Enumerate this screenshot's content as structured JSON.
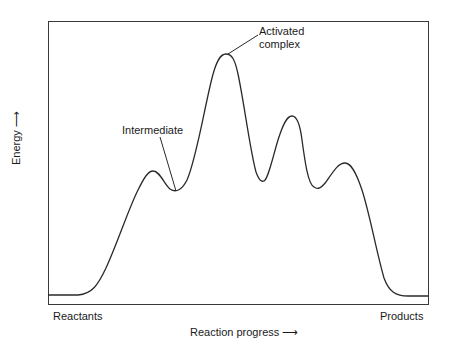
{
  "diagram": {
    "type": "reaction-energy-profile",
    "y_axis_label": "Energy ⟶",
    "x_axis_label": "Reaction progress ⟶",
    "x_start_label": "Reactants",
    "x_end_label": "Products",
    "annotations": {
      "intermediate": "Intermediate",
      "activated_complex_line1": "Activated",
      "activated_complex_line2": "complex"
    },
    "line_color": "#2a2a2a",
    "curve_points": [
      {
        "x": 48,
        "y": 295,
        "note": "reactants baseline"
      },
      {
        "x": 152,
        "y": 171,
        "note": "first small peak"
      },
      {
        "x": 176,
        "y": 190,
        "note": "intermediate (local minimum)"
      },
      {
        "x": 226,
        "y": 54,
        "note": "activated complex (highest peak)"
      },
      {
        "x": 262,
        "y": 180,
        "note": "local minimum"
      },
      {
        "x": 293,
        "y": 117,
        "note": "peak"
      },
      {
        "x": 318,
        "y": 189,
        "note": "local minimum"
      },
      {
        "x": 345,
        "y": 163,
        "note": "peak"
      },
      {
        "x": 429,
        "y": 295,
        "note": "products baseline"
      }
    ]
  }
}
